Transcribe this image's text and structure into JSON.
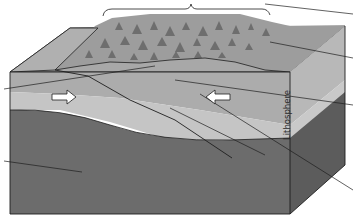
{
  "diagram": {
    "type": "block-diagram",
    "labels": {
      "lithosphere": "Lithosphere"
    },
    "arrows": [
      {
        "name": "left-plate-motion",
        "direction": "right"
      },
      {
        "name": "right-plate-motion",
        "direction": "left"
      }
    ],
    "leader_lines_count": 7,
    "colors": {
      "top_surface": "#a9a9a9",
      "mountain_region": "#9c9c9c",
      "upper_crust": "#ababab",
      "lower_lithosphere": "#c4c4c4",
      "mantle": "#6c6c6c",
      "side_light": "#bdbdbd",
      "side_mantle": "#5c5c5c",
      "outline": "#1e1e1e"
    }
  }
}
